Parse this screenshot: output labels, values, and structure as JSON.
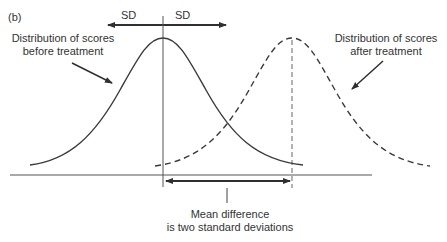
{
  "panel_label": "(b)",
  "sd_labels": {
    "left": "SD",
    "right": "SD"
  },
  "annotations": {
    "before": {
      "line1": "Distribution of scores",
      "line2": "before treatment"
    },
    "after": {
      "line1": "Distribution of scores",
      "line2": "after treatment"
    },
    "mean_difference": {
      "line1": "Mean difference",
      "line2": "is two standard deviations"
    }
  },
  "curves": [
    {
      "name": "before treatment",
      "style": "solid",
      "mean_x": 163
    },
    {
      "name": "after treatment",
      "style": "dashed",
      "mean_x": 292
    }
  ],
  "colors": {
    "line": "#3a3a3a",
    "text": "#333333",
    "background": "#ffffff"
  }
}
